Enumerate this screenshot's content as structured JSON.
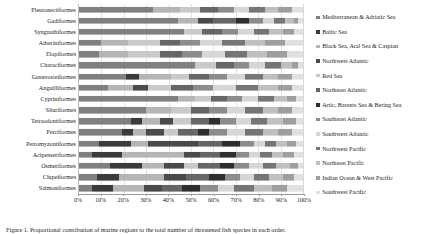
{
  "caption": "Figure 1. Proportional contribution of marine regions to the total number of threatened fish species in each order.",
  "chart_data": {
    "type": "bar",
    "orientation": "horizontal",
    "stacked": true,
    "normalized": true,
    "title": "",
    "xlabel": "",
    "ylabel": "",
    "xlim": [
      0,
      100
    ],
    "xticks": [
      "0%",
      "10%",
      "20%",
      "30%",
      "40%",
      "50%",
      "60%",
      "70%",
      "80%",
      "90%",
      "100%"
    ],
    "grid": true,
    "legend_position": "right",
    "categories": [
      "Pleuronectiformes",
      "Gadiformes",
      "Syngnathiformes",
      "Atheriniformes",
      "Elopiformes",
      "Characiformes",
      "Gasterosteiformes",
      "Anguilliformes",
      "Cypriniformes",
      "Siluriformes",
      "Tetraodontiformes",
      "Perciformes",
      "Petromyzontiformes",
      "Acipenseriformes",
      "Osmeriformes",
      "Clupeiformes",
      "Salmoniformes"
    ],
    "series": [
      {
        "name": "Mediterranean & Adriatic Sea",
        "color": "#808080",
        "values": [
          33,
          44,
          47,
          10,
          9,
          52,
          21,
          13,
          44,
          30,
          23,
          19,
          9,
          6,
          14,
          8,
          6
        ]
      },
      {
        "name": "Baltic Sea",
        "color": "#3a3a3a",
        "values": [
          0,
          0,
          0,
          0,
          0,
          0,
          6,
          0,
          0,
          0,
          5,
          5,
          14,
          13,
          14,
          10,
          9
        ]
      },
      {
        "name": "Black Sea, Aral Sea & Caspian",
        "color": "#b5b5b5",
        "values": [
          12,
          9,
          0,
          12,
          13,
          0,
          14,
          11,
          8,
          11,
          8,
          6,
          8,
          28,
          10,
          20,
          14
        ]
      },
      {
        "name": "Northwest Atlantic",
        "color": "#4a4a4a",
        "values": [
          0,
          7,
          0,
          0,
          0,
          0,
          0,
          7,
          0,
          0,
          6,
          8,
          22,
          7,
          9,
          10,
          8
        ]
      },
      {
        "name": "Red Sea",
        "color": "#c9c9c9",
        "values": [
          9,
          0,
          8,
          14,
          14,
          9,
          8,
          10,
          7,
          9,
          8,
          6,
          0,
          0,
          6,
          0,
          0
        ]
      },
      {
        "name": "Northeast Atlantic",
        "color": "#666666",
        "values": [
          8,
          10,
          9,
          9,
          10,
          8,
          9,
          10,
          7,
          8,
          8,
          9,
          11,
          9,
          10,
          10,
          9
        ]
      },
      {
        "name": "Artic, Barents Sea & Bering Sea",
        "color": "#2e2e2e",
        "values": [
          0,
          6,
          0,
          0,
          0,
          0,
          0,
          0,
          0,
          0,
          5,
          5,
          8,
          7,
          6,
          7,
          8
        ]
      },
      {
        "name": "Southeast Atlantic",
        "color": "#8c8c8c",
        "values": [
          7,
          6,
          7,
          9,
          9,
          7,
          8,
          9,
          7,
          8,
          7,
          8,
          6,
          6,
          7,
          7,
          8
        ]
      },
      {
        "name": "Southwest Atlantic",
        "color": "#d6d6d6",
        "values": [
          7,
          5,
          7,
          10,
          10,
          7,
          8,
          10,
          7,
          8,
          7,
          8,
          5,
          5,
          6,
          6,
          7
        ]
      },
      {
        "name": "Northwest Pacific",
        "color": "#757575",
        "values": [
          7,
          5,
          7,
          10,
          10,
          7,
          8,
          10,
          7,
          8,
          7,
          8,
          5,
          5,
          6,
          7,
          9
        ]
      },
      {
        "name": "Northeast Pacific",
        "color": "#bfbfbf",
        "values": [
          6,
          4,
          6,
          9,
          9,
          5,
          7,
          9,
          6,
          7,
          7,
          7,
          5,
          5,
          6,
          6,
          8
        ]
      },
      {
        "name": "Indian Ocean & West Pacific",
        "color": "#9e9e9e",
        "values": [
          6,
          2,
          5,
          9,
          9,
          3,
          6,
          6,
          4,
          6,
          6,
          6,
          4,
          5,
          4,
          5,
          7
        ]
      },
      {
        "name": "Southwest Pacific",
        "color": "#e0e0e0",
        "values": [
          5,
          2,
          4,
          8,
          7,
          2,
          5,
          5,
          3,
          5,
          3,
          5,
          3,
          4,
          2,
          4,
          7
        ]
      }
    ]
  }
}
